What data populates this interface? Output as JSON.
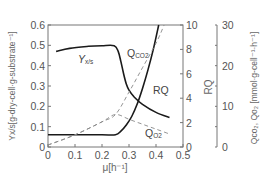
{
  "chart_data": {
    "type": "line",
    "title": "",
    "xlabel": "μ[h⁻¹]",
    "ylabel": "Yx/s[g-dry-cell·g-substrate⁻¹]",
    "ylabel_right1": "RQ",
    "ylabel_right2": "Qco₂, Qo₂ [mmol·g-cell⁻¹·h⁻¹]",
    "xlim": [
      0,
      0.5
    ],
    "ylim": [
      0,
      0.6
    ],
    "ylim_right1": [
      0,
      10
    ],
    "ylim_right2": [
      0,
      30
    ],
    "x_ticks": [
      "0",
      "0.1",
      "0.2",
      "0.3",
      "0.4",
      "0.5"
    ],
    "y_ticks": [
      "0",
      "0.1",
      "0.2",
      "0.3",
      "0.4",
      "0.5",
      "0.6"
    ],
    "y_right1_ticks": [
      "0",
      "2",
      "4",
      "6",
      "8",
      "10"
    ],
    "y_right2_ticks": [
      "0",
      "10",
      "20",
      "30"
    ],
    "grid": false,
    "legend": "inline labels",
    "series": [
      {
        "name": "Yx/s",
        "label": "Y",
        "label_sub": "x/s",
        "axis": "left",
        "style": "solid",
        "x": [
          0.03,
          0.08,
          0.15,
          0.2,
          0.245,
          0.26,
          0.27,
          0.28,
          0.29,
          0.3,
          0.32,
          0.35,
          0.4,
          0.45
        ],
        "values": [
          0.47,
          0.485,
          0.495,
          0.498,
          0.498,
          0.47,
          0.42,
          0.36,
          0.31,
          0.28,
          0.245,
          0.21,
          0.17,
          0.145
        ]
      },
      {
        "name": "RQ",
        "label": "RQ",
        "axis": "right1",
        "style": "solid",
        "x": [
          0.0,
          0.1,
          0.2,
          0.25,
          0.27,
          0.29,
          0.31,
          0.33,
          0.35,
          0.37,
          0.39,
          0.41
        ],
        "values": [
          1.0,
          1.0,
          1.0,
          1.0,
          1.3,
          1.8,
          2.5,
          3.5,
          4.8,
          6.3,
          8.0,
          10.0
        ]
      },
      {
        "name": "Qco2",
        "label": "Q",
        "label_sub": "CO2",
        "axis": "right2",
        "style": "dashed",
        "x": [
          0.0,
          0.1,
          0.2,
          0.25,
          0.3,
          0.35,
          0.4,
          0.43
        ],
        "values": [
          0.5,
          3.0,
          6.2,
          8.0,
          13.5,
          19.5,
          25.5,
          30.0
        ]
      },
      {
        "name": "Qo2",
        "label": "Q",
        "label_sub": "O2",
        "axis": "right2",
        "style": "dashed",
        "x": [
          0.0,
          0.1,
          0.2,
          0.25,
          0.3,
          0.35,
          0.4,
          0.45
        ],
        "values": [
          0.5,
          3.0,
          6.2,
          8.0,
          6.8,
          5.6,
          4.4,
          3.2
        ]
      }
    ]
  }
}
